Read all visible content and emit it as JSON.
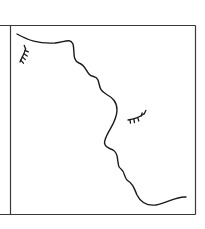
{
  "figure": {
    "description": "Line drawing of two facing profiles sharing one wavy contour, each with a closed eye (lashes)",
    "colors": {
      "background": "#ffffff",
      "frame": "#3a3a3a",
      "stroke": "#1a1a1a"
    },
    "frame": {
      "left": 10,
      "top": 25,
      "right": 195,
      "bottom": 214,
      "outer_left": 0
    },
    "profile_contour": "M17,34 C28,40 38,44 55,43 C65,42 70,38 73,44 C75,52 72,60 79,63 C85,65 86,71 89,74 C92,78 96,75 98,80 C100,86 99,90 106,94 C113,98 117,102 117,110 C117,122 108,130 105,140 C103,146 108,148 113,150 C118,153 117,157 118,162 C119,165 117,166 121,169 C125,172 124,177 127,180 C133,184 134,188 137,195 C141,203 147,206 156,205 C168,203 176,196 186,197",
    "eyes": [
      {
        "name": "left-profile-eye",
        "x": 20,
        "y": 54,
        "rotation": -55
      },
      {
        "name": "right-profile-eye",
        "x": 128,
        "y": 117,
        "rotation": -10
      }
    ]
  }
}
